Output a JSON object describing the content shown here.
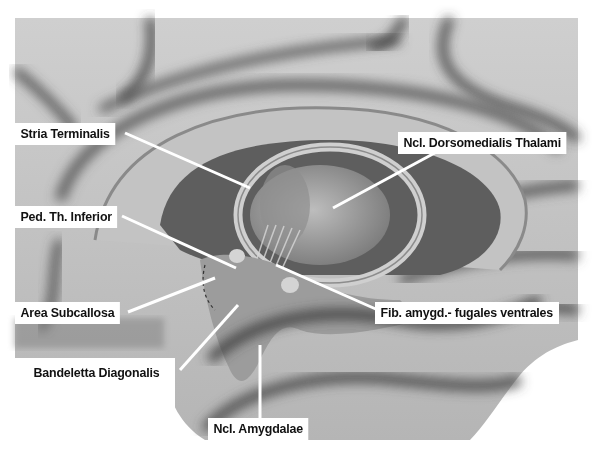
{
  "diagram": {
    "style": "grayscale airbrush illustration",
    "colors": {
      "background": "#ffffff",
      "cortex_light": "#c9c9c9",
      "cortex_mid": "#9a9a9a",
      "sulcus_dark": "#3a3a3a",
      "ventricle_dark": "#5a5a5a",
      "leader_line": "#ffffff",
      "label_bg": "#ffffff",
      "label_text": "#111111"
    },
    "labels": [
      {
        "id": "stria-terminalis",
        "text": "Stria Terminalis"
      },
      {
        "id": "ncl-dorsomedialis-thalami",
        "text": "Ncl. Dorsomedialis Thalami"
      },
      {
        "id": "ped-th-inferior",
        "text": "Ped. Th. Inferior"
      },
      {
        "id": "area-subcallosa",
        "text": "Area Subcallosa"
      },
      {
        "id": "fib-amygd-fugales-ventrales",
        "text": "Fib. amygd.- fugales ventrales"
      },
      {
        "id": "bandeletta-diagonalis",
        "text": "Bandeletta Diagonalis"
      },
      {
        "id": "ncl-amygdalae",
        "text": "Ncl. Amygdalae"
      }
    ]
  }
}
